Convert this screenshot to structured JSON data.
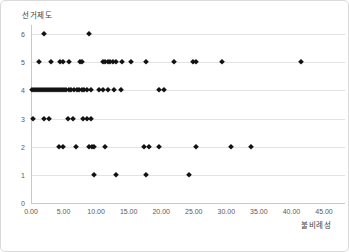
{
  "chart": {
    "y_axis_title": "선거제도",
    "x_axis_title": "불비례성",
    "colors": {
      "marker": "#121212",
      "gridline": "#e3e3e3",
      "axis_line": "#c9c9c9",
      "tick_text": "#595959",
      "title_text": "#404040",
      "background": "#ffffff",
      "border": "#d9d9d9"
    }
  },
  "chart_data": {
    "type": "scatter",
    "marker": "diamond",
    "title": "",
    "xlabel": "불비례성",
    "ylabel": "선거제도",
    "xlim": [
      0,
      45
    ],
    "ylim": [
      0,
      6
    ],
    "grid": "horizontal",
    "legend": "none",
    "xticks": {
      "values": [
        0,
        5,
        10,
        15,
        20,
        25,
        30,
        35,
        40,
        45
      ],
      "labels": [
        "0.00",
        "5.00",
        "10.00",
        "15.00",
        "20.00",
        "25.00",
        "30.00",
        "35.00",
        "40.00",
        "45.00"
      ]
    },
    "yticks": {
      "values": [
        0,
        1,
        2,
        3,
        4,
        5,
        6
      ],
      "labels": [
        "0",
        "1",
        "2",
        "3",
        "4",
        "5",
        "6"
      ]
    },
    "series": [
      {
        "name": "선거제도 vs 불비례성",
        "points": [
          [
            2.0,
            6
          ],
          [
            8.9,
            6
          ],
          [
            1.2,
            5
          ],
          [
            3.1,
            5
          ],
          [
            4.4,
            5
          ],
          [
            4.9,
            5
          ],
          [
            5.9,
            5
          ],
          [
            7.5,
            5
          ],
          [
            7.9,
            5
          ],
          [
            11.0,
            5
          ],
          [
            11.4,
            5
          ],
          [
            11.8,
            5
          ],
          [
            12.2,
            5
          ],
          [
            12.6,
            5
          ],
          [
            13.0,
            5
          ],
          [
            14.0,
            5
          ],
          [
            15.3,
            5
          ],
          [
            17.7,
            5
          ],
          [
            22.0,
            5
          ],
          [
            24.9,
            5
          ],
          [
            25.4,
            5
          ],
          [
            29.3,
            5
          ],
          [
            41.5,
            5
          ],
          [
            0.2,
            4
          ],
          [
            0.5,
            4
          ],
          [
            0.8,
            4
          ],
          [
            1.1,
            4
          ],
          [
            1.4,
            4
          ],
          [
            1.7,
            4
          ],
          [
            2.0,
            4
          ],
          [
            2.3,
            4
          ],
          [
            2.6,
            4
          ],
          [
            2.9,
            4
          ],
          [
            3.2,
            4
          ],
          [
            3.5,
            4
          ],
          [
            3.8,
            4
          ],
          [
            4.1,
            4
          ],
          [
            4.4,
            4
          ],
          [
            4.7,
            4
          ],
          [
            5.0,
            4
          ],
          [
            5.4,
            4
          ],
          [
            5.8,
            4
          ],
          [
            6.2,
            4
          ],
          [
            6.6,
            4
          ],
          [
            7.0,
            4
          ],
          [
            7.4,
            4
          ],
          [
            7.8,
            4
          ],
          [
            8.2,
            4
          ],
          [
            8.6,
            4
          ],
          [
            9.2,
            4
          ],
          [
            10.4,
            4
          ],
          [
            11.0,
            4
          ],
          [
            11.8,
            4
          ],
          [
            12.8,
            4
          ],
          [
            13.8,
            4
          ],
          [
            19.7,
            4
          ],
          [
            20.4,
            4
          ],
          [
            0.3,
            3
          ],
          [
            2.0,
            3
          ],
          [
            2.8,
            3
          ],
          [
            5.7,
            3
          ],
          [
            6.4,
            3
          ],
          [
            8.0,
            3
          ],
          [
            8.6,
            3
          ],
          [
            9.2,
            3
          ],
          [
            4.3,
            2
          ],
          [
            4.9,
            2
          ],
          [
            6.9,
            2
          ],
          [
            8.9,
            2
          ],
          [
            9.3,
            2
          ],
          [
            9.7,
            2
          ],
          [
            11.3,
            2
          ],
          [
            17.4,
            2
          ],
          [
            18.1,
            2
          ],
          [
            19.7,
            2
          ],
          [
            25.3,
            2
          ],
          [
            30.7,
            2
          ],
          [
            33.8,
            2
          ],
          [
            9.7,
            1
          ],
          [
            13.1,
            1
          ],
          [
            17.7,
            1
          ],
          [
            24.3,
            1
          ]
        ]
      }
    ]
  }
}
